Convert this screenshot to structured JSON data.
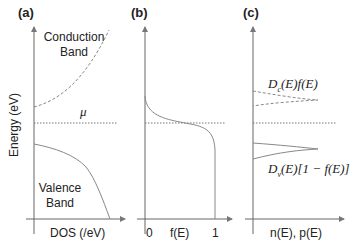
{
  "figure": {
    "panels": [
      {
        "id": "a",
        "label": "(a)",
        "xlabel": "DOS (/eV)",
        "ylabel": "Energy (eV)",
        "annotations": {
          "conduction": "Conduction Band",
          "conduction_l1": "Conduction",
          "conduction_l2": "Band",
          "valence_l1": "Valence",
          "valence_l2": "Band",
          "mu": "μ"
        }
      },
      {
        "id": "b",
        "label": "(b)",
        "xlabel": "f(E)",
        "xticks": [
          "0",
          "1"
        ]
      },
      {
        "id": "c",
        "label": "(c)",
        "xlabel": "n(E), p(E)",
        "annotations": {
          "electrons": "Dc(E)f(E)",
          "holes": "Dv(E)[1 − f(E)]"
        }
      }
    ]
  },
  "text": {
    "a_label": "(a)",
    "b_label": "(b)",
    "c_label": "(c)",
    "conduction_l1": "Conduction",
    "conduction_l2": "Band",
    "valence_l1": "Valence",
    "valence_l2": "Band",
    "mu": "μ",
    "ylabel": "Energy (eV)",
    "a_xlabel": "DOS (/eV)",
    "b_tick0": "0",
    "b_xlabel": "f(E)",
    "b_tick1": "1",
    "c_xlabel": "n(E), p(E)",
    "c_n_D": "D",
    "c_n_sub": "c",
    "c_n_rest": "(E)f(E)",
    "c_p_D": "D",
    "c_p_sub": "v",
    "c_p_rest": "(E)[1 − f(E)]"
  },
  "colors": {
    "curve": "#8a8a8a",
    "axis": "#555555"
  }
}
